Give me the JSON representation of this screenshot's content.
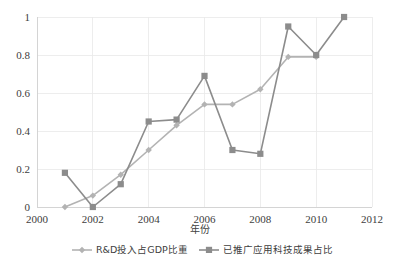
{
  "chart_data": {
    "type": "line",
    "title": "",
    "xlabel": "年份",
    "ylabel": "",
    "x": [
      2001,
      2002,
      2003,
      2004,
      2005,
      2006,
      2007,
      2008,
      2009,
      2010,
      2011
    ],
    "xlim": [
      2000,
      2012
    ],
    "ylim": [
      0,
      1
    ],
    "xticks": [
      "2000",
      "2002",
      "2004",
      "2006",
      "2008",
      "2010",
      "2012"
    ],
    "xtick_values": [
      2000,
      2002,
      2004,
      2006,
      2008,
      2010,
      2012
    ],
    "yticks": [
      "0",
      "0.2",
      "0.4",
      "0.6",
      "0.8",
      "1"
    ],
    "ytick_values": [
      0,
      0.2,
      0.4,
      0.6,
      0.8,
      1
    ],
    "grid": true,
    "legend_position": "bottom",
    "series": [
      {
        "name": "R&D投入占GDP比重",
        "marker": "diamond",
        "color": "#b3b3b3",
        "x": [
          2001,
          2002,
          2003,
          2004,
          2005,
          2006,
          2007,
          2008,
          2009,
          2010
        ],
        "values": [
          0.0,
          0.06,
          0.17,
          0.3,
          0.43,
          0.54,
          0.54,
          0.62,
          0.79,
          0.79
        ]
      },
      {
        "name": "已推广应用科技成果占比",
        "marker": "square",
        "color": "#8c8c8c",
        "x": [
          2001,
          2002,
          2003,
          2004,
          2005,
          2006,
          2007,
          2008,
          2009,
          2010,
          2011
        ],
        "values": [
          0.18,
          0.0,
          0.12,
          0.45,
          0.46,
          0.69,
          0.3,
          0.28,
          0.95,
          0.8,
          1.0
        ]
      }
    ]
  },
  "legend": {
    "items": [
      {
        "label": "R&D投入占GDP比重",
        "marker": "diamond-marker-icon",
        "color": "#b3b3b3"
      },
      {
        "label": "已推广应用科技成果占比",
        "marker": "square-marker-icon",
        "color": "#8c8c8c"
      }
    ]
  },
  "colors": {
    "series_1": "#b3b3b3",
    "series_2": "#8c8c8c",
    "grid": "#e8e8e8",
    "axis": "#d0d0d0",
    "text": "#404040",
    "background": "#ffffff"
  }
}
